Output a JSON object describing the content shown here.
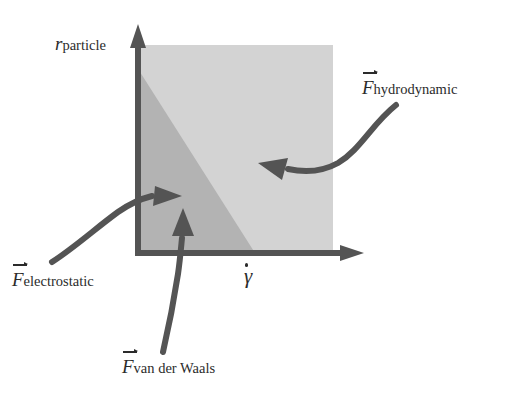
{
  "figure": {
    "name": "colloidal-force-regime-diagram",
    "background_color": "#ffffff"
  },
  "axes": {
    "color": "#545454",
    "origin_x": 138,
    "origin_y": 253,
    "y_axis": {
      "symbol": "r",
      "subscript": "particle",
      "full_label": "r_particle",
      "description": "particle radius"
    },
    "x_axis": {
      "symbol": "γ",
      "accent": "dot",
      "full_label": "γ̇",
      "description": "shear rate"
    }
  },
  "regions": [
    {
      "name": "hydrodynamic-region",
      "fill": "#d3d3d3",
      "description": "upper-right light grey area of the square"
    },
    {
      "name": "colloidal-region",
      "fill": "#b3b3b3",
      "description": "lower-left darker grey triangle bounded by the diagonal"
    }
  ],
  "plot_box": {
    "left": 140,
    "top": 45,
    "right": 333,
    "bottom": 253,
    "diagonal_top_y": 72,
    "diagonal_bottom_x": 255
  },
  "annotations": [
    {
      "id": "hydrodynamic",
      "symbol": "F",
      "accent": "vector",
      "subscript": "hydrodynamic",
      "full_label": "F⃗_hydrodynamic",
      "arrow": "curved-arrow-pointing-up-left",
      "target_region": "hydrodynamic-region"
    },
    {
      "id": "electrostatic",
      "symbol": "F",
      "accent": "vector",
      "subscript": "electrostatic",
      "full_label": "F⃗_electrostatic",
      "arrow": "curved-arrow-pointing-right",
      "target_region": "colloidal-region"
    },
    {
      "id": "van-der-waals",
      "symbol": "F",
      "accent": "vector",
      "subscript": "van der Waals",
      "full_label": "F⃗_van der Waals",
      "arrow": "curved-arrow-pointing-up",
      "target_region": "colloidal-region"
    }
  ],
  "arrow_color": "#545454"
}
